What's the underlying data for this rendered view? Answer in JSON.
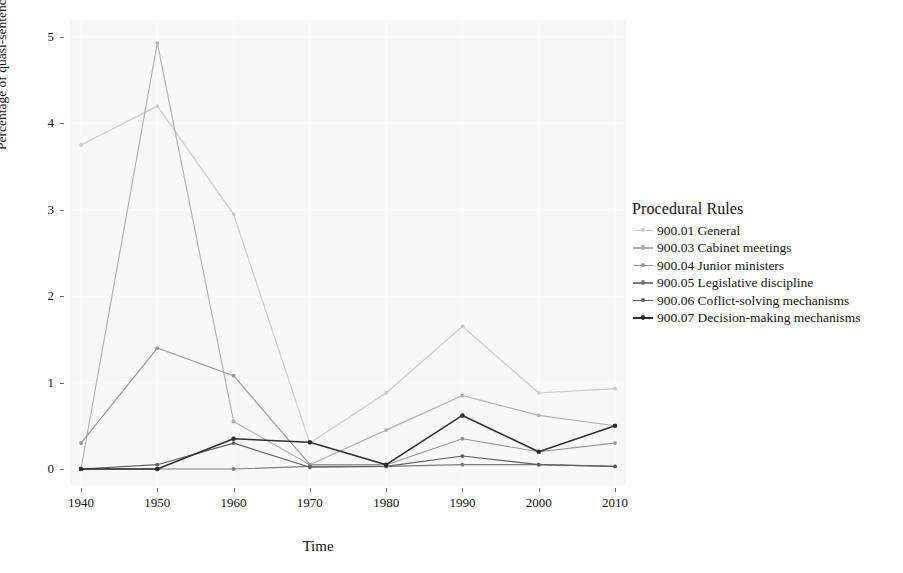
{
  "chart_data": {
    "type": "line",
    "title": "",
    "xlabel": "Time",
    "ylabel": "Percentage of quasi-sentences",
    "legend_title": "Procedural Rules",
    "legend_position": "right",
    "grid": true,
    "x": [
      1940,
      1950,
      1960,
      1970,
      1980,
      1990,
      2000,
      2010
    ],
    "xtick_labels": [
      "1940",
      "1950",
      "1960",
      "1970",
      "1980",
      "1990",
      "2000",
      "2010"
    ],
    "ytick_labels": [
      "0",
      "1",
      "2",
      "3",
      "4",
      "5"
    ],
    "ytick_values": [
      0,
      1,
      2,
      3,
      4,
      5
    ],
    "xlim": [
      1940,
      2010
    ],
    "ylim": [
      0,
      5
    ],
    "series": [
      {
        "name": "900.01 General",
        "color": "#c9c9c9",
        "values": [
          3.75,
          4.2,
          2.95,
          0.3,
          0.88,
          1.65,
          0.88,
          0.93
        ]
      },
      {
        "name": "900.03 Cabinet meetings",
        "color": "#b0b0b0",
        "values": [
          0.0,
          4.93,
          0.55,
          0.05,
          0.45,
          0.85,
          0.62,
          0.5
        ]
      },
      {
        "name": "900.04 Junior ministers",
        "color": "#969696",
        "values": [
          0.3,
          1.4,
          1.08,
          0.05,
          0.05,
          0.35,
          0.2,
          0.3
        ]
      },
      {
        "name": "900.05 Legislative discipline",
        "color": "#7c7c7c",
        "values": [
          0.0,
          0.0,
          0.0,
          0.03,
          0.03,
          0.05,
          0.05,
          0.03
        ]
      },
      {
        "name": "900.06 Coflict-solving mechanisms",
        "color": "#5e5e5e",
        "values": [
          0.0,
          0.05,
          0.3,
          0.02,
          0.03,
          0.15,
          0.05,
          0.03
        ]
      },
      {
        "name": "900.07 Decision-making mechanisms",
        "color": "#2e2e2e",
        "values": [
          0.0,
          0.0,
          0.35,
          0.31,
          0.05,
          0.62,
          0.2,
          0.5
        ]
      }
    ]
  },
  "axes": {
    "x_title": "Time",
    "y_title": "Percentage of quasi-sentences"
  },
  "legend": {
    "title": "Procedural Rules",
    "items": [
      {
        "label": "900.01 General"
      },
      {
        "label": "900.03 Cabinet meetings"
      },
      {
        "label": "900.04 Junior ministers"
      },
      {
        "label": "900.05 Legislative discipline"
      },
      {
        "label": "900.06 Coflict-solving mechanisms"
      },
      {
        "label": "900.07 Decision-making mechanisms"
      }
    ]
  }
}
